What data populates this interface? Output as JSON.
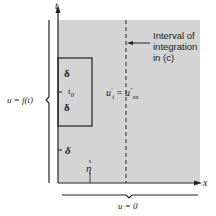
{
  "diagram": {
    "axes": {
      "vertical": "t",
      "horizontal": "x"
    },
    "equation": "u′t = u″xx",
    "equation_main_left": "u",
    "equation_sup_left": "′",
    "equation_sub_left": "t",
    "equation_eq": "=",
    "equation_main_right": "u",
    "equation_sup_right": "″",
    "equation_sub_right": "xx",
    "annotation": [
      "Interval of",
      "integration",
      "in (c)"
    ],
    "boundary_left": "u = f(t)",
    "boundary_bottom": "u = 0",
    "box_labels": {
      "delta_top": "δ",
      "t0": "t",
      "t0_sub": "0",
      "delta_bottom": "δ"
    },
    "lower_delta": "δ",
    "eta": "η",
    "colors": {
      "region": "#d4d4d4",
      "ink": "#222222"
    }
  }
}
